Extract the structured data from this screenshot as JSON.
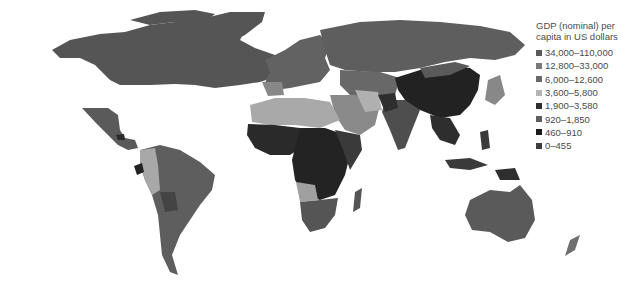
{
  "legend": {
    "title_line1": "GDP (nominal) per",
    "title_line2": "capita in US dollars",
    "items": [
      {
        "label": "34,000–110,000",
        "color": "#595959"
      },
      {
        "label": "12,800–33,000",
        "color": "#7a7a7a"
      },
      {
        "label": "6,000–12,600",
        "color": "#6a6a6a"
      },
      {
        "label": "3,600–5,800",
        "color": "#b4b4b4"
      },
      {
        "label": "1,900–3,580",
        "color": "#2e2e2e"
      },
      {
        "label": "920–1,850",
        "color": "#5e5e5e"
      },
      {
        "label": "460–910",
        "color": "#1c1c1c"
      },
      {
        "label": "0–455",
        "color": "#3c3c3c"
      }
    ]
  },
  "regions": {
    "north_america": "#555555",
    "greenland": "#555555",
    "mexico_central": "#5a5a5a",
    "south_america": "#5e5e5e",
    "andes_west": "#a8a8a8",
    "europe": "#626262",
    "russia": "#5e5e5e",
    "north_africa": "#a9a9a9",
    "west_africa": "#2a2a2a",
    "central_africa": "#232323",
    "southern_africa": "#555555",
    "middle_east": "#8a8a8a",
    "china": "#222222",
    "india": "#4e4e4e",
    "southeast_asia": "#2e2e2e",
    "japan": "#888888",
    "australia": "#5a5a5a",
    "new_zealand": "#707070",
    "indonesia": "#3a3a3a"
  }
}
